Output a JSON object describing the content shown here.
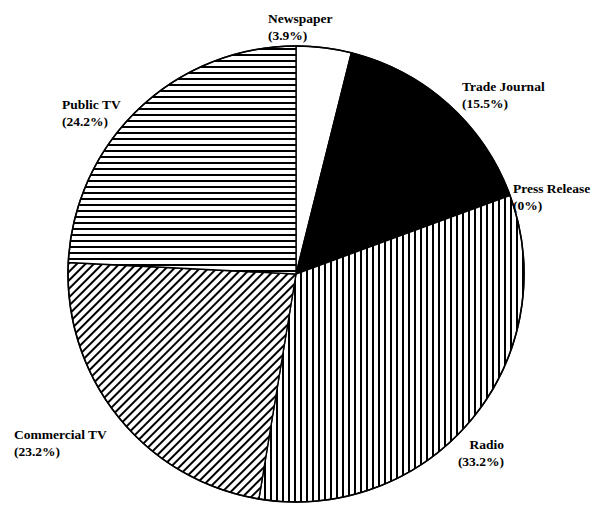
{
  "figure": {
    "background_color": "#ffffff",
    "outline_color": "#000000",
    "center_x": 296,
    "center_y": 274,
    "radius": 228
  },
  "chart_data": {
    "type": "pie",
    "title": "",
    "subtitle": "",
    "xlabel": "",
    "ylabel": "",
    "grid": false,
    "legend_position": "outside-labels",
    "start_angle_deg": 90,
    "direction": "clockwise",
    "total_percent": 100,
    "categories": [
      "Newspaper",
      "Trade Journal",
      "Press Release",
      "Radio",
      "Commercial TV",
      "Public TV"
    ],
    "values": [
      3.9,
      15.5,
      0,
      33.2,
      23.2,
      24.2
    ],
    "slices": [
      {
        "label": "Newspaper",
        "percent_text": "(3.9%)",
        "value": 3.9,
        "fill": "solid-white",
        "fill_color": "#ffffff",
        "start_deg": 0.0,
        "sweep_deg": 14.04
      },
      {
        "label": "Trade Journal",
        "percent_text": "(15.5%)",
        "value": 15.5,
        "fill": "solid-black",
        "fill_color": "#000000",
        "start_deg": 14.04,
        "sweep_deg": 55.8
      },
      {
        "label": "Press Release",
        "percent_text": "(0%)",
        "value": 0,
        "fill": "none",
        "fill_color": "#ffffff",
        "start_deg": 69.84,
        "sweep_deg": 0.0
      },
      {
        "label": "Radio",
        "percent_text": "(33.2%)",
        "value": 33.2,
        "fill": "vertical-hatch",
        "fill_color": "#ffffff",
        "start_deg": 69.84,
        "sweep_deg": 119.52
      },
      {
        "label": "Commercial TV",
        "percent_text": "(23.2%)",
        "value": 23.2,
        "fill": "diagonal-hatch",
        "fill_color": "#ffffff",
        "start_deg": 189.36,
        "sweep_deg": 83.52
      },
      {
        "label": "Public TV",
        "percent_text": "(24.2%)",
        "value": 24.2,
        "fill": "horizontal-hatch",
        "fill_color": "#ffffff",
        "start_deg": 272.88,
        "sweep_deg": 87.12
      }
    ]
  }
}
